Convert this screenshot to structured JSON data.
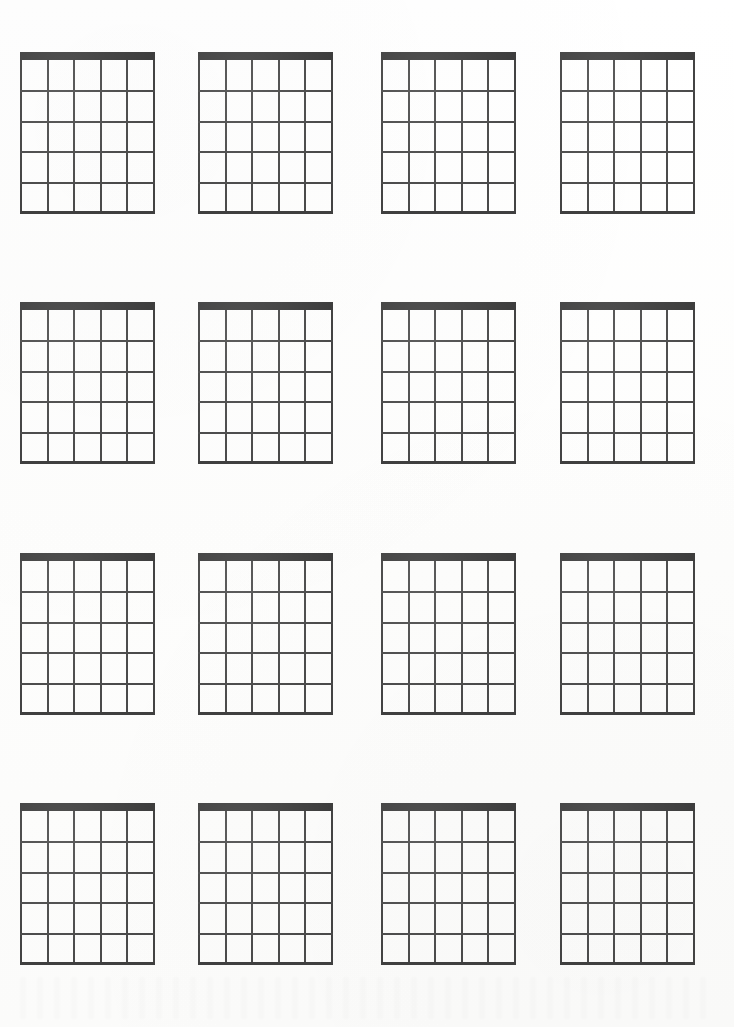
{
  "page": {
    "background_color": "#fefefe",
    "width": 734,
    "height": 1027,
    "ink_color": "#4a4a4a",
    "nut_color": "#3d3d3d"
  },
  "chart_data": {
    "type": "table",
    "grid_columns": 4,
    "grid_rows": 4,
    "diagram_count": 16,
    "diagram": {
      "strings": 6,
      "string_spaces": 5,
      "frets": 5,
      "fret_lines": 5,
      "has_nut": true,
      "nut_thickness_px": 8,
      "width_px": 135,
      "height_px": 162,
      "line_width_px": 2
    },
    "column_x": [
      20,
      198,
      381,
      560
    ],
    "row_y": [
      52,
      302,
      553,
      803
    ],
    "labels": [],
    "annotations": [],
    "diagrams": [
      {
        "index": 1,
        "row": 1,
        "col": 1,
        "name": "chord-diagram-r1c1",
        "label": "",
        "fingerings": []
      },
      {
        "index": 2,
        "row": 1,
        "col": 2,
        "name": "chord-diagram-r1c2",
        "label": "",
        "fingerings": []
      },
      {
        "index": 3,
        "row": 1,
        "col": 3,
        "name": "chord-diagram-r1c3",
        "label": "",
        "fingerings": []
      },
      {
        "index": 4,
        "row": 1,
        "col": 4,
        "name": "chord-diagram-r1c4",
        "label": "",
        "fingerings": []
      },
      {
        "index": 5,
        "row": 2,
        "col": 1,
        "name": "chord-diagram-r2c1",
        "label": "",
        "fingerings": []
      },
      {
        "index": 6,
        "row": 2,
        "col": 2,
        "name": "chord-diagram-r2c2",
        "label": "",
        "fingerings": []
      },
      {
        "index": 7,
        "row": 2,
        "col": 3,
        "name": "chord-diagram-r2c3",
        "label": "",
        "fingerings": []
      },
      {
        "index": 8,
        "row": 2,
        "col": 4,
        "name": "chord-diagram-r2c4",
        "label": "",
        "fingerings": []
      },
      {
        "index": 9,
        "row": 3,
        "col": 1,
        "name": "chord-diagram-r3c1",
        "label": "",
        "fingerings": []
      },
      {
        "index": 10,
        "row": 3,
        "col": 2,
        "name": "chord-diagram-r3c2",
        "label": "",
        "fingerings": []
      },
      {
        "index": 11,
        "row": 3,
        "col": 3,
        "name": "chord-diagram-r3c3",
        "label": "",
        "fingerings": []
      },
      {
        "index": 12,
        "row": 3,
        "col": 4,
        "name": "chord-diagram-r3c4",
        "label": "",
        "fingerings": []
      },
      {
        "index": 13,
        "row": 4,
        "col": 1,
        "name": "chord-diagram-r4c1",
        "label": "",
        "fingerings": []
      },
      {
        "index": 14,
        "row": 4,
        "col": 2,
        "name": "chord-diagram-r4c2",
        "label": "",
        "fingerings": []
      },
      {
        "index": 15,
        "row": 4,
        "col": 3,
        "name": "chord-diagram-r4c3",
        "label": "",
        "fingerings": []
      },
      {
        "index": 16,
        "row": 4,
        "col": 4,
        "name": "chord-diagram-r4c4",
        "label": "",
        "fingerings": []
      }
    ]
  }
}
